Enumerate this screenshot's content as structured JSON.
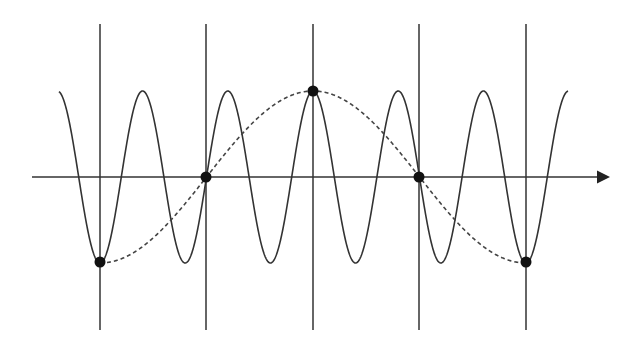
{
  "diagram": {
    "type": "aliasing-illustration",
    "colors": {
      "background": "#ffffff",
      "stroke": "#333333",
      "sample_dot": "#111111"
    },
    "axis": {
      "x_start": 32,
      "x_end": 610,
      "y": 177,
      "arrow": true
    },
    "sample_lines": {
      "x_positions": [
        100,
        206,
        313,
        419,
        526
      ],
      "y_top": 24,
      "y_bottom": 330
    },
    "signal": {
      "label": "high-frequency-signal",
      "style": "solid",
      "x_start": 59,
      "x_end": 568,
      "center_y": 177,
      "amplitude_px": 86,
      "period_px": 85.2,
      "phase_ref_x": 100
    },
    "alias": {
      "label": "aliased-signal",
      "style": "dashed",
      "x_start": 100,
      "x_end": 526,
      "center_y": 177,
      "amplitude_px": 86,
      "period_px": 426,
      "phase_ref_x": 100
    },
    "sample_points": [
      {
        "x": 100,
        "y": 262
      },
      {
        "x": 206,
        "y": 177
      },
      {
        "x": 313,
        "y": 91
      },
      {
        "x": 419,
        "y": 177
      },
      {
        "x": 526,
        "y": 262
      }
    ]
  }
}
